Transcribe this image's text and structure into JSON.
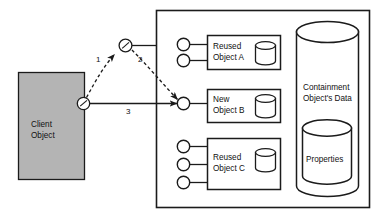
{
  "diagram": {
    "colors": {
      "client_fill": "#b4b4b4",
      "stroke": "#1b1b1b",
      "background": "#ffffff",
      "node_fill": "#ffffff"
    },
    "client": {
      "label_line1": "Client",
      "label_line2": "Object",
      "port_name": "client-port"
    },
    "junction": {
      "name": "junction-node"
    },
    "arrows": [
      {
        "id": "1",
        "label": "1",
        "style": "dashed",
        "from": "client-port",
        "to": "junction-node"
      },
      {
        "id": "2",
        "label": "2",
        "style": "dashed",
        "from": "junction-node",
        "to": "new-object-b-port"
      },
      {
        "id": "3",
        "label": "3",
        "style": "solid",
        "from": "client-port",
        "to": "new-object-b-port"
      }
    ],
    "container": {
      "name": "containment-object-box",
      "objects": [
        {
          "id": "reused-object-a",
          "label_line1": "Reused",
          "label_line2": "Object A",
          "ports": 2,
          "cylinder": true
        },
        {
          "id": "new-object-b",
          "label_line1": "New",
          "label_line2": "Object B",
          "ports": 1,
          "cylinder": true
        },
        {
          "id": "reused-object-c",
          "label_line1": "Reused",
          "label_line2": "Object C",
          "ports": 3,
          "cylinder": true
        }
      ],
      "data_store": {
        "id": "containment-object-data",
        "label_line1": "Containment",
        "label_line2": "Object's Data"
      },
      "properties_store": {
        "id": "properties-store",
        "label": "Properties"
      }
    }
  }
}
